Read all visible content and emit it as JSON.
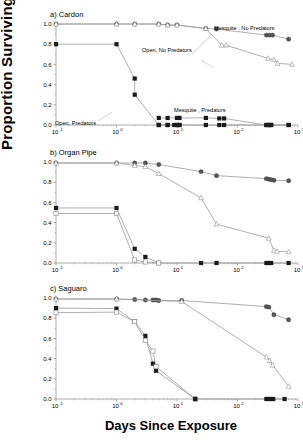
{
  "figure": {
    "ylabel": "Proportion Surviving",
    "xlabel": "Days Since Exposure",
    "panel_titles": [
      "a) Cardon",
      "b)  Organ Pipe",
      "c)  Saguaro"
    ]
  },
  "axes": {
    "ylim": [
      0.0,
      1.0
    ],
    "yticks": [
      0.0,
      0.2,
      0.4,
      0.6,
      0.8,
      1.0
    ],
    "ytick_labels": [
      "0.0",
      "0.2",
      "0.4",
      "0.6",
      "0.8",
      "1.0"
    ],
    "xlim_log10": [
      -1,
      3
    ],
    "xticks_log10": [
      -1,
      0,
      1,
      2,
      3
    ],
    "xtick_bases": [
      "10",
      "10",
      "10",
      "10",
      "10"
    ],
    "xtick_exponents": [
      "-1",
      "0",
      "1",
      "2",
      "3"
    ],
    "grid": false
  },
  "annotations": {
    "mesquite_no_predators": "Mesquite , No Predators",
    "open_no_predators": "Open, No Predators",
    "mesquite_predators": "Mesquite , Predators",
    "open_predators": "Open, Predators"
  },
  "colors": {
    "filled_circle": "#555555",
    "filled_square": "#1a1a1a",
    "open_triangle_edge": "#999999",
    "open_square_edge": "#888888",
    "line": "#9a9a9a",
    "axis": "#8a8a8a",
    "text": "#000000"
  },
  "chart_data": {
    "type": "line",
    "xlabel": "Days Since Exposure",
    "ylabel": "Proportion Surviving",
    "xscale": "log10",
    "xlim": [
      0.1,
      1000
    ],
    "ylim": [
      0,
      1
    ],
    "legend_position": "inline-annotations",
    "panels": [
      {
        "label": "a) Cardon",
        "series": [
          {
            "name": "Mesquite , No Predators",
            "marker": "filled-circle",
            "x": [
              0.1,
              1.0,
              2.0,
              5.0,
              7.0,
              10.0,
              30.0,
              45.0,
              300.0,
              340.0,
              380.0,
              700.0
            ],
            "y": [
              1.0,
              1.0,
              1.0,
              1.0,
              0.99,
              0.99,
              0.955,
              0.95,
              0.89,
              0.89,
              0.89,
              0.85
            ]
          },
          {
            "name": "Open, No Predators",
            "marker": "open-triangle",
            "x": [
              0.1,
              1.0,
              2.0,
              5.0,
              7.0,
              10.0,
              30.0,
              55.0,
              65.0,
              320.0,
              400.0,
              460.0,
              800.0
            ],
            "y": [
              1.0,
              1.0,
              1.0,
              1.0,
              0.99,
              0.99,
              0.955,
              0.79,
              0.79,
              0.66,
              0.645,
              0.61,
              0.6
            ]
          },
          {
            "name": "Open, Predators",
            "marker": "filled-square",
            "x": [
              0.1,
              1.0,
              2.0,
              2.0,
              5.0,
              7.0,
              10.0,
              11.0
            ],
            "y": [
              0.8,
              0.8,
              0.46,
              0.3,
              0.0,
              0.0,
              0.0,
              0.0
            ]
          },
          {
            "name": "Mesquite , Predators",
            "marker": "filled-square",
            "x": [
              5.0,
              7.0,
              10.0,
              11.0,
              30.0,
              50.0,
              60.0,
              300.0,
              330.0,
              360.0,
              700.0
            ],
            "y": [
              0.07,
              0.07,
              0.07,
              0.07,
              0.07,
              0.065,
              0.065,
              0.0,
              0.0,
              0.0,
              0.0
            ]
          },
          {
            "name": "Mesquite , Predators zeros",
            "marker": "filled-square",
            "x": [
              5.0,
              7.0,
              9.0,
              10.0,
              11.0,
              30.0,
              50.0,
              60.0,
              300.0,
              330.0,
              360.0,
              700.0
            ],
            "y": [
              0.0,
              0.0,
              0.0,
              0.0,
              0.0,
              0.0,
              0.0,
              0.0,
              0.0,
              0.0,
              0.0,
              0.0
            ]
          }
        ]
      },
      {
        "label": "b)  Organ Pipe",
        "series": [
          {
            "name": "Mesquite , No Predators",
            "marker": "filled-circle",
            "x": [
              0.1,
              1.0,
              2.0,
              3.0,
              5.0,
              25.0,
              45.0,
              300.0,
              330.0,
              360.0,
              400.0,
              700.0
            ],
            "y": [
              0.99,
              0.99,
              0.99,
              0.99,
              0.975,
              0.905,
              0.865,
              0.835,
              0.83,
              0.825,
              0.82,
              0.815
            ]
          },
          {
            "name": "Open, No Predators",
            "marker": "open-triangle",
            "x": [
              0.1,
              1.0,
              2.0,
              3.0,
              5.0,
              25.0,
              45.0,
              330.0,
              400.0,
              450.0,
              700.0
            ],
            "y": [
              0.99,
              0.99,
              0.965,
              0.955,
              0.885,
              0.645,
              0.385,
              0.245,
              0.125,
              0.115,
              0.11
            ]
          },
          {
            "name": "Mesquite , Predators",
            "marker": "filled-square",
            "x": [
              0.1,
              1.0,
              2.0,
              3.0,
              5.0,
              25.0,
              45.0,
              300.0,
              330.0,
              360.0,
              700.0
            ],
            "y": [
              0.545,
              0.545,
              0.14,
              0.06,
              0.0,
              0.0,
              0.0,
              0.0,
              0.0,
              0.0,
              0.0
            ]
          },
          {
            "name": "Open, Predators",
            "marker": "open-square",
            "x": [
              0.1,
              1.0,
              2.0,
              3.0,
              5.0
            ],
            "y": [
              0.49,
              0.49,
              0.03,
              0.01,
              0.0
            ]
          }
        ]
      },
      {
        "label": "c)  Saguaro",
        "series": [
          {
            "name": "Mesquite , No Predators",
            "marker": "filled-circle",
            "x": [
              0.1,
              1.0,
              2.0,
              3.0,
              4.0,
              4.5,
              5.0,
              12.0,
              300.0,
              330.0,
              400.0,
              700.0
            ],
            "y": [
              0.99,
              0.99,
              0.985,
              0.98,
              0.98,
              0.98,
              0.975,
              0.975,
              0.915,
              0.91,
              0.835,
              0.785
            ]
          },
          {
            "name": "Open, No Predators",
            "marker": "open-triangle",
            "x": [
              0.1,
              1.0,
              12.0,
              300.0,
              340.0,
              380.0,
              700.0
            ],
            "y": [
              0.99,
              0.99,
              0.965,
              0.415,
              0.38,
              0.335,
              0.125
            ]
          },
          {
            "name": "Mesquite , Predators",
            "marker": "filled-square",
            "x": [
              0.1,
              1.0,
              2.0,
              3.0,
              4.0,
              4.5,
              20.0
            ],
            "y": [
              0.9,
              0.895,
              0.765,
              0.625,
              0.35,
              0.28,
              0.0
            ]
          },
          {
            "name": "Open, Predators",
            "marker": "open-square",
            "x": [
              0.1,
              1.0,
              2.0,
              3.0,
              4.0,
              4.5,
              20.0
            ],
            "y": [
              0.855,
              0.86,
              0.765,
              0.58,
              0.475,
              0.32,
              0.0
            ]
          },
          {
            "name": "Baseline zeros",
            "marker": "filled-square",
            "x": [
              20.0,
              300.0,
              330.0,
              360.0,
              390.0,
              600.0
            ],
            "y": [
              0.0,
              0.0,
              0.0,
              0.0,
              0.0,
              0.0
            ]
          }
        ]
      }
    ]
  }
}
